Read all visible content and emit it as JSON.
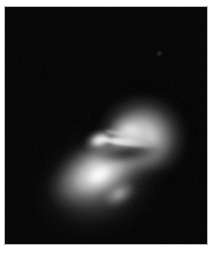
{
  "plate": {
    "title": "Grayscale astronomical exposure",
    "caption": "",
    "background_color": "#ffffff",
    "sky_color": "#000000",
    "border_rule_color": "#b9b9b9",
    "highlight_color": "#ffffff",
    "width_px": 222,
    "height_px": 261
  },
  "field": {
    "label": "sky-field",
    "left_px": 5,
    "top_px": 7,
    "width_px": 202,
    "height_px": 237
  },
  "objects": [
    {
      "id": "lobe-upper",
      "label": "upper-right rounded lobe",
      "shape": "round-elliptical",
      "center_px": [
        140,
        122
      ],
      "size_px": [
        88,
        84
      ],
      "position_angle_deg": -8,
      "peak_brightness": "bright",
      "peak_gray": "#ffffff"
    },
    {
      "id": "disk-lower",
      "label": "lower-left inclined disk",
      "shape": "elongated-ellipse",
      "center_px": [
        94,
        164
      ],
      "size_px": [
        128,
        72
      ],
      "position_angle_deg": -29,
      "peak_brightness": "bright",
      "peak_gray": "#ffffff"
    },
    {
      "id": "bridge-knot",
      "label": "bright knot at the junction",
      "shape": "compact-knot",
      "center_px": [
        95,
        133
      ],
      "size_px": [
        34,
        22
      ],
      "position_angle_deg": -18,
      "peak_brightness": "very bright",
      "peak_gray": "#ffffff"
    },
    {
      "id": "bridge-jet",
      "label": "thin linear bridge / jet",
      "shape": "linear-filament",
      "start_px": [
        96,
        135
      ],
      "end_px": [
        154,
        141
      ],
      "position_angle_deg": 6,
      "peak_brightness": "bright",
      "peak_gray": "#ffffff"
    },
    {
      "id": "dust-lane",
      "label": "dark lane between the bodies",
      "shape": "dark-band",
      "center_px": [
        123,
        146
      ],
      "size_px": [
        74,
        20
      ],
      "position_angle_deg": -7,
      "peak_brightness": "dark",
      "peak_gray": "#000000"
    },
    {
      "id": "field-star",
      "label": "faint field point source",
      "shape": "point",
      "center_px": [
        154,
        46
      ],
      "size_px": [
        5,
        5
      ],
      "peak_brightness": "faint",
      "peak_gray": "#9a9a9a"
    }
  ]
}
